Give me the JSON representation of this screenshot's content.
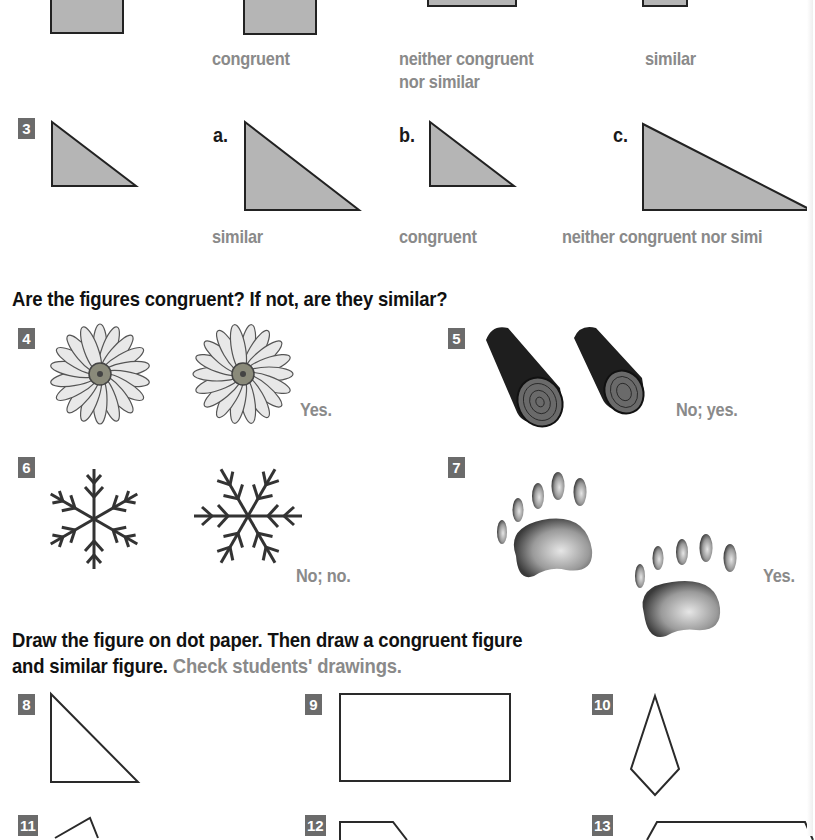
{
  "problem_2": {
    "answers": [
      {
        "lines": [
          "congruent"
        ]
      },
      {
        "lines": [
          "neither congruent",
          "nor similar"
        ]
      },
      {
        "lines": [
          "similar"
        ]
      }
    ]
  },
  "problem_3": {
    "number": "3",
    "options": [
      {
        "letter": "a.",
        "answer": "similar"
      },
      {
        "letter": "b.",
        "answer": "congruent"
      },
      {
        "letter": "c.",
        "answer": "neither congruent nor simi"
      }
    ]
  },
  "section_congruent_similar": {
    "heading": "Are the figures congruent? If not, are they similar?",
    "items": [
      {
        "number": "4",
        "figure": "daisy-flower",
        "answer": "Yes."
      },
      {
        "number": "5",
        "figure": "wooden-log",
        "answer": "No; yes."
      },
      {
        "number": "6",
        "figure": "snowflake",
        "answer": "No; no."
      },
      {
        "number": "7",
        "figure": "bear-paw-print",
        "answer": "Yes."
      }
    ]
  },
  "section_dot_paper": {
    "heading_line1": "Draw the figure on dot paper. Then draw a congruent figure",
    "heading_line2": "and similar figure.",
    "note": "Check students' drawings.",
    "items": [
      {
        "number": "8",
        "figure": "right-triangle"
      },
      {
        "number": "9",
        "figure": "rectangle"
      },
      {
        "number": "10",
        "figure": "kite"
      },
      {
        "number": "11",
        "figure": "quadrilateral"
      },
      {
        "number": "12",
        "figure": "pentagon"
      },
      {
        "number": "13",
        "figure": "trapezoid"
      }
    ]
  },
  "colors": {
    "answer_gray": "#8a8a8a",
    "badge_gray": "#6b6b6b",
    "shape_fill": "#b5b5b5"
  }
}
